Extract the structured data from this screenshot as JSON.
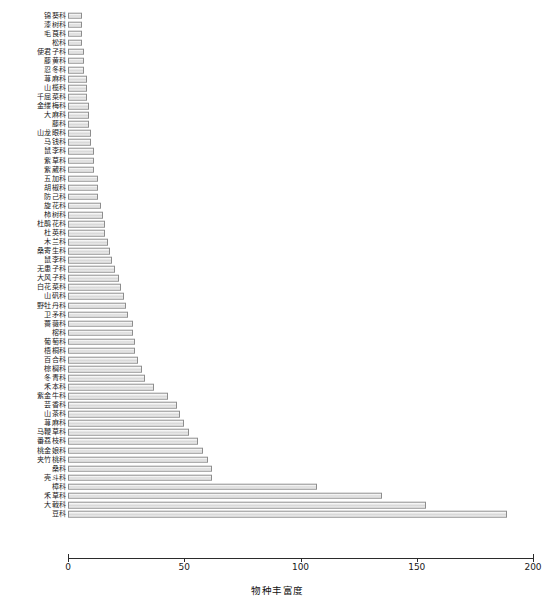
{
  "chart_data": {
    "type": "bar",
    "orientation": "horizontal",
    "title": "",
    "xlabel": "物种丰富度",
    "ylabel": "",
    "xlim": [
      0,
      200
    ],
    "xticks": [
      0,
      50,
      100,
      150,
      200
    ],
    "xtick_labels": [
      "0",
      "50",
      "100",
      "150",
      "200"
    ],
    "grid": false,
    "legend": null,
    "categories": [
      "锦葵科",
      "漆树科",
      "毛茛科",
      "松科",
      "使君子科",
      "藤黄科",
      "忍冬科",
      "荨麻科",
      "山榄科",
      "千屈菜科",
      "金缕梅科",
      "大麻科",
      "藤科",
      "山龙眼科",
      "马钱科",
      "鼠李科",
      "紫草科",
      "紫葳科",
      "五加科",
      "胡椒科",
      "防己科",
      "旋花科",
      "柿树科",
      "杜鹃花科",
      "杜英科",
      "木兰科",
      "桑寄生科",
      "鼠李科",
      "无患子科",
      "大风子科",
      "白花菜科",
      "山矾科",
      "野牡丹科",
      "卫矛科",
      "蔷薇科",
      "榕科",
      "葡萄科",
      "梧桐科",
      "百合科",
      "棕榈科",
      "冬青科",
      "禾本科",
      "紫金牛科",
      "芸香科",
      "山茶科",
      "荨麻科",
      "马鞭草科",
      "番荔枝科",
      "桃金娘科",
      "夹竹桃科",
      "桑科",
      "壳斗科",
      "樟科",
      "禾草科",
      "大戟科",
      "豆科"
    ],
    "values": [
      6,
      6,
      6,
      6,
      7,
      7,
      7,
      8,
      8,
      8,
      9,
      9,
      9,
      10,
      10,
      11,
      11,
      11,
      13,
      13,
      13,
      14,
      15,
      16,
      16,
      17,
      18,
      19,
      20,
      22,
      23,
      24,
      25,
      26,
      28,
      28,
      29,
      29,
      30,
      32,
      33,
      37,
      43,
      47,
      48,
      50,
      52,
      56,
      58,
      60,
      62,
      62,
      107,
      135,
      154,
      189
    ]
  },
  "axis": {
    "x_title": "物种丰富度"
  }
}
